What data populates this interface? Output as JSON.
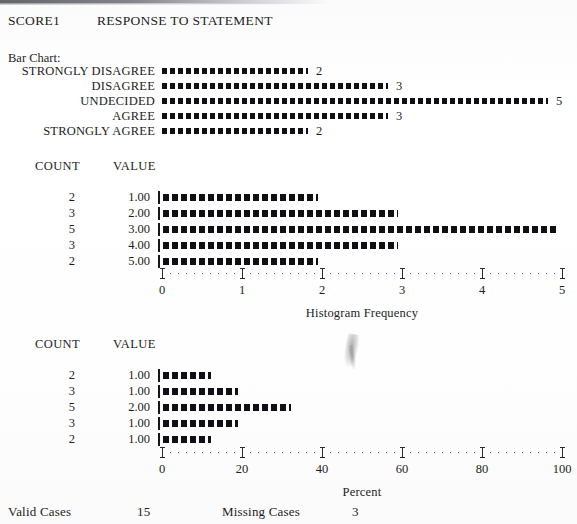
{
  "header": {
    "variable": "SCORE1",
    "title": "RESPONSE TO STATEMENT",
    "bar_chart_label": "Bar Chart:"
  },
  "columns": {
    "count": "COUNT",
    "value": "VALUE"
  },
  "footer": {
    "valid_label": "Valid Cases",
    "valid_value": "15",
    "missing_label": "Missing Cases",
    "missing_value": "3"
  },
  "chart_data": [
    {
      "type": "bar",
      "title": "Bar Chart:",
      "orientation": "horizontal",
      "categories": [
        "STRONGLY DISAGREE",
        "DISAGREE",
        "UNDECIDED",
        "AGREE",
        "STRONGLY AGREE"
      ],
      "values": [
        2,
        3,
        5,
        3,
        2
      ],
      "value_labels": [
        "2",
        "3",
        "5",
        "3",
        "2"
      ],
      "xlabel": "",
      "ylabel": "",
      "xlim": [
        0,
        5
      ],
      "grid": false,
      "legend": "none"
    },
    {
      "type": "bar",
      "title": "Histogram Frequency",
      "orientation": "horizontal",
      "columns": [
        "COUNT",
        "VALUE"
      ],
      "counts": [
        2,
        3,
        5,
        3,
        2
      ],
      "categories": [
        "1.00",
        "2.00",
        "3.00",
        "4.00",
        "5.00"
      ],
      "values": [
        2,
        3,
        5,
        3,
        2
      ],
      "xlabel": "Histogram Frequency",
      "ylabel": "VALUE",
      "xlim": [
        0,
        5
      ],
      "xticks": [
        "0",
        "1",
        "2",
        "3",
        "4",
        "5"
      ],
      "grid": false,
      "legend": "none"
    },
    {
      "type": "bar",
      "title": "Percent",
      "orientation": "horizontal",
      "columns": [
        "COUNT",
        "VALUE"
      ],
      "counts": [
        2,
        3,
        5,
        3,
        2
      ],
      "categories": [
        "1.00",
        "1.00",
        "2.00",
        "1.00",
        "1.00"
      ],
      "values": [
        13.3,
        20.0,
        33.3,
        20.0,
        13.3
      ],
      "xlabel": "Percent",
      "ylabel": "VALUE",
      "xlim": [
        0,
        100
      ],
      "xticks": [
        "0",
        "20",
        "40",
        "60",
        "80",
        "100"
      ],
      "grid": false,
      "legend": "none"
    }
  ]
}
